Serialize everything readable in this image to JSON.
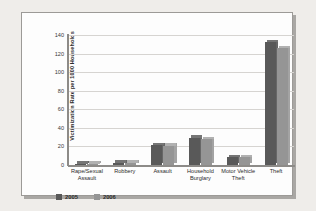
{
  "chart_data": {
    "type": "bar",
    "title": "",
    "subtitle": "",
    "xlabel": "",
    "ylabel": "Victimization Rate per 1000 Households",
    "ylim": [
      0,
      140
    ],
    "yticks": [
      0,
      20,
      40,
      60,
      80,
      100,
      120,
      140
    ],
    "grid": true,
    "legend_position": "bottom-left",
    "categories": [
      "Rape/Sexual Assault",
      "Robbery",
      "Assault",
      "Household Burglary",
      "Motor Vehicle Theft",
      "Theft"
    ],
    "series": [
      {
        "name": "2005",
        "color": "#595959",
        "values": [
          1.0,
          2.6,
          21.5,
          29.5,
          8.5,
          132.0
        ]
      },
      {
        "name": "2006",
        "color": "#959595",
        "values": [
          1.0,
          2.4,
          21.0,
          27.5,
          8.4,
          126.0
        ]
      }
    ]
  },
  "axis": {
    "tick_labels": [
      "140",
      "120",
      "100",
      "80",
      "60",
      "40",
      "20",
      "0"
    ]
  },
  "legend": {
    "items": [
      {
        "label": "2005",
        "color": "#595959"
      },
      {
        "label": "2006",
        "color": "#959595"
      }
    ]
  },
  "colors": {
    "series_2005": "#595959",
    "series_2006": "#959595",
    "panel_background": "#fdfdfd",
    "page_background": "#efedea",
    "gridline": "#d6d4d1",
    "axis": "#8d8b88"
  }
}
